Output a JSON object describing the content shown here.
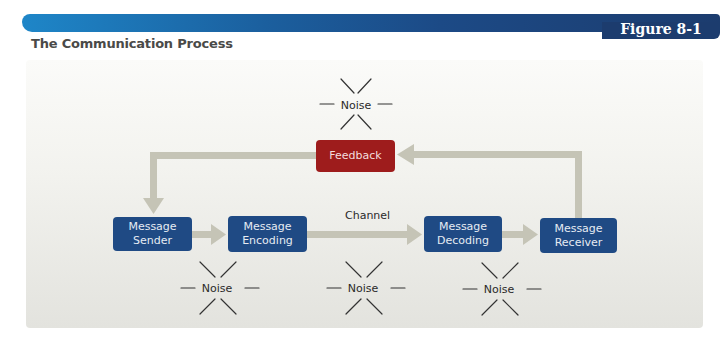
{
  "header": {
    "figure_label": "Figure 8-1",
    "title": "The Communication Process"
  },
  "diagram": {
    "nodes": {
      "sender": {
        "line1": "Message",
        "line2": "Sender"
      },
      "encoding": {
        "line1": "Message",
        "line2": "Encoding"
      },
      "decoding": {
        "line1": "Message",
        "line2": "Decoding"
      },
      "receiver": {
        "line1": "Message",
        "line2": "Receiver"
      },
      "feedback": {
        "label": "Feedback"
      }
    },
    "channel_label": "Channel",
    "noise": [
      {
        "label": "Noise",
        "position": "above-feedback"
      },
      {
        "label": "Noise",
        "position": "below-sender-encoding"
      },
      {
        "label": "Noise",
        "position": "below-channel"
      },
      {
        "label": "Noise",
        "position": "below-decoding-receiver"
      }
    ],
    "edges": [
      {
        "from": "Message Sender",
        "to": "Message Encoding"
      },
      {
        "from": "Message Encoding",
        "to": "Message Decoding",
        "label": "Channel"
      },
      {
        "from": "Message Decoding",
        "to": "Message Receiver"
      },
      {
        "from": "Message Receiver",
        "to": "Feedback"
      },
      {
        "from": "Feedback",
        "to": "Message Sender"
      }
    ],
    "colors": {
      "node_blue": "#1f4a84",
      "feedback_red": "#9e1c1c",
      "arrow_gray": "#c5c4b6",
      "header_left": "#1e86c8",
      "header_right": "#1c3c6e"
    }
  }
}
